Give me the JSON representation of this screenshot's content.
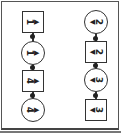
{
  "diagram": {
    "left_column": [
      {
        "shape": "square",
        "label": "1",
        "arrow": "▶"
      },
      {
        "shape": "circle",
        "label": "1",
        "arrow": "▶"
      },
      {
        "shape": "square",
        "label": "4",
        "arrow": "▶"
      },
      {
        "shape": "circle",
        "label": "4",
        "arrow": "▶"
      }
    ],
    "right_column": [
      {
        "shape": "circle",
        "label": "2",
        "arrow": "◀"
      },
      {
        "shape": "square",
        "label": "2",
        "arrow": "◀"
      },
      {
        "shape": "circle",
        "label": "3",
        "arrow": "◀"
      },
      {
        "shape": "square",
        "label": "3",
        "arrow": "◀"
      }
    ],
    "colors": {
      "stroke": "#333333",
      "background": "#ffffff"
    }
  }
}
